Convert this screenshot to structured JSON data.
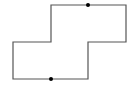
{
  "diagram": {
    "type": "rectilinear-polygon",
    "stroke_color": "#555555",
    "dot_color": "#000000",
    "background": "#ffffff",
    "outline_points": "51,5 126,5 126,42 88,42 88,79 13,79 13,42 51,42",
    "dots": [
      {
        "x": 88,
        "y": 5,
        "r": 2
      },
      {
        "x": 51,
        "y": 79,
        "r": 2
      }
    ]
  }
}
